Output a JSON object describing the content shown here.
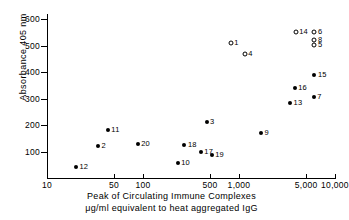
{
  "chart_data": {
    "type": "scatter",
    "title": "",
    "xlabel_line1": "Peak of Circulating Immune Complexes",
    "xlabel_line2": "μg/ml equivalent to heat aggregated IgG",
    "ylabel": "Absorbance 405 nm",
    "xscale": "log",
    "yscale": "linear",
    "xlim": [
      10,
      10000
    ],
    "ylim": [
      0,
      620
    ],
    "grid": false,
    "legend": "none",
    "xticks": [
      10,
      50,
      100,
      500,
      1000,
      5000,
      10000
    ],
    "xticklabels": [
      "10",
      "50",
      "100",
      "500",
      "1,000",
      "5,000",
      "10,000"
    ],
    "yticks": [
      100,
      200,
      300,
      400,
      500,
      600
    ],
    "yticklabels": [
      "100",
      "200",
      "300",
      "400",
      "500",
      "600"
    ],
    "marker_styles": {
      "filled": "filled-circle",
      "open": "open-circle"
    },
    "points": [
      {
        "label": "12",
        "x": 20,
        "y": 40,
        "marker": "filled",
        "label_side": "right"
      },
      {
        "label": "2",
        "x": 34,
        "y": 120,
        "marker": "filled",
        "label_side": "right"
      },
      {
        "label": "11",
        "x": 43,
        "y": 180,
        "marker": "filled",
        "label_side": "right"
      },
      {
        "label": "20",
        "x": 88,
        "y": 128,
        "marker": "filled",
        "label_side": "right"
      },
      {
        "label": "10",
        "x": 230,
        "y": 55,
        "marker": "filled",
        "label_side": "right"
      },
      {
        "label": "18",
        "x": 270,
        "y": 123,
        "marker": "filled",
        "label_side": "right"
      },
      {
        "label": "17",
        "x": 400,
        "y": 100,
        "marker": "filled",
        "label_side": "right"
      },
      {
        "label": "19",
        "x": 520,
        "y": 88,
        "marker": "filled",
        "label_side": "right"
      },
      {
        "label": "3",
        "x": 460,
        "y": 210,
        "marker": "filled",
        "label_side": "right"
      },
      {
        "label": "1",
        "x": 820,
        "y": 512,
        "marker": "open",
        "label_side": "right"
      },
      {
        "label": "4",
        "x": 1150,
        "y": 468,
        "marker": "open",
        "label_side": "right"
      },
      {
        "label": "9",
        "x": 1700,
        "y": 172,
        "marker": "filled",
        "label_side": "right"
      },
      {
        "label": "13",
        "x": 3400,
        "y": 282,
        "marker": "filled",
        "label_side": "right"
      },
      {
        "label": "16",
        "x": 3800,
        "y": 340,
        "marker": "filled",
        "label_side": "right"
      },
      {
        "label": "14",
        "x": 3900,
        "y": 553,
        "marker": "open",
        "label_side": "right"
      },
      {
        "label": "7",
        "x": 6000,
        "y": 305,
        "marker": "filled",
        "label_side": "right"
      },
      {
        "label": "15",
        "x": 6100,
        "y": 388,
        "marker": "filled",
        "label_side": "right"
      },
      {
        "label": "6",
        "x": 6100,
        "y": 553,
        "marker": "open",
        "label_side": "right"
      },
      {
        "label": "8",
        "x": 6100,
        "y": 522,
        "marker": "open",
        "label_side": "right"
      },
      {
        "label": "5",
        "x": 6100,
        "y": 504,
        "marker": "open",
        "label_side": "right"
      }
    ]
  }
}
